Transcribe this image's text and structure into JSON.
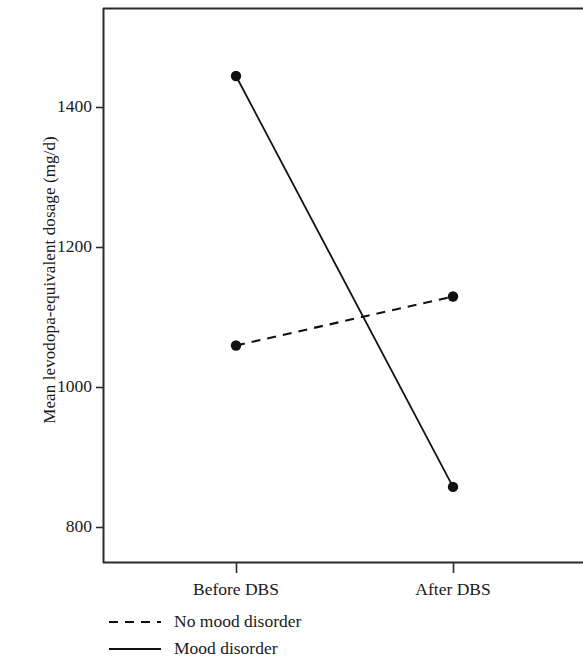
{
  "chart_data": {
    "type": "line",
    "title": "",
    "subtitle": "",
    "xlabel": "",
    "ylabel": "Mean levodopa-equivalent dosage (mg/d)",
    "categories": [
      "Before DBS",
      "After DBS"
    ],
    "series": [
      {
        "name": "No mood disorder",
        "values": [
          1060,
          1130
        ],
        "linestyle": "dashed",
        "color": "#000000",
        "marker": "filled-circle"
      },
      {
        "name": "Mood disorder",
        "values": [
          1445,
          858
        ],
        "linestyle": "solid",
        "color": "#000000",
        "marker": "filled-circle"
      }
    ],
    "ylim": [
      745,
      1495
    ],
    "yticks": [
      800,
      1000,
      1200,
      1400
    ],
    "ytick_labels": [
      "800",
      "1000",
      "1200",
      "1400"
    ],
    "xtick_labels": [
      "Before DBS",
      "After DBS"
    ],
    "grid": false,
    "legend_position": "below-axes-left",
    "frame": "box"
  },
  "axis": {
    "y_title": "Mean levodopa-equivalent dosage (mg/d)",
    "y_ticks": [
      {
        "label": "1400",
        "value": 1400
      },
      {
        "label": "1200",
        "value": 1200
      },
      {
        "label": "1000",
        "value": 1000
      },
      {
        "label": "800",
        "value": 800
      }
    ],
    "x_ticks": [
      {
        "label": "Before DBS"
      },
      {
        "label": "After DBS"
      }
    ]
  },
  "legend": {
    "items": [
      {
        "label": "No mood disorder",
        "style": "dashed"
      },
      {
        "label": "Mood disorder",
        "style": "solid"
      }
    ]
  },
  "colors": {
    "ink": "#1a1a1a",
    "line": "#111111",
    "background": "#ffffff"
  }
}
